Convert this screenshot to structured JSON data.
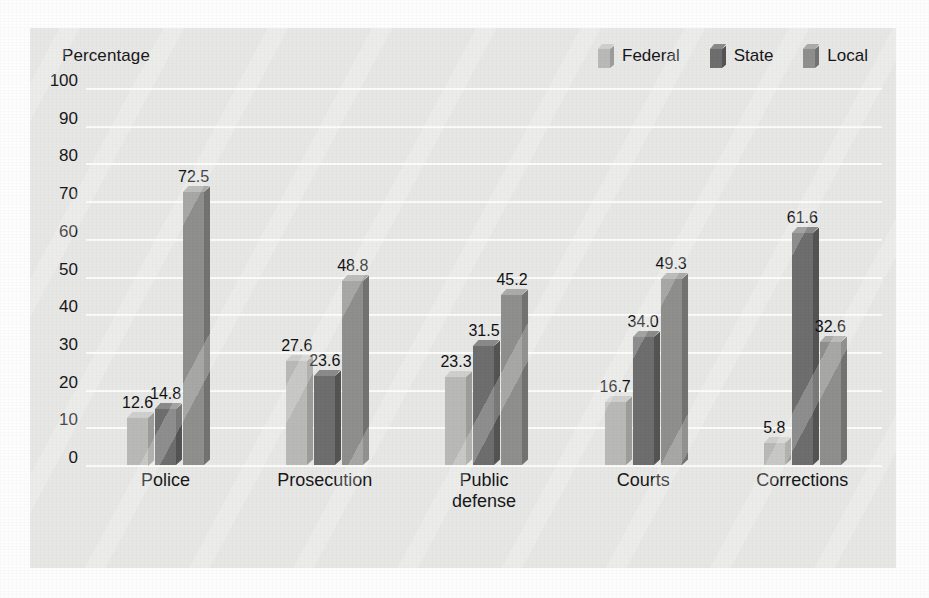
{
  "chart_data": {
    "type": "bar",
    "title": "",
    "subtitle": "",
    "ylabel": "Percentage",
    "xlabel": "",
    "ylim": [
      0,
      100
    ],
    "ytick_step": 10,
    "yticks": [
      "100",
      "90",
      "80",
      "70",
      "60",
      "50",
      "40",
      "30",
      "20",
      "10",
      "0"
    ],
    "grid": true,
    "legend_position": "top-right",
    "categories": [
      "Police",
      "Prosecution",
      "Public defense",
      "Courts",
      "Corrections"
    ],
    "category_lines": [
      [
        "Police"
      ],
      [
        "Prosecution"
      ],
      [
        "Public",
        "defense"
      ],
      [
        "Courts"
      ],
      [
        "Corrections"
      ]
    ],
    "series": [
      {
        "name": "Federal",
        "color": "#b9b9b7",
        "color_top": "#cfcfcd",
        "color_side": "#9d9d9b",
        "values": [
          12.6,
          27.6,
          23.3,
          16.7,
          5.8
        ],
        "labels": [
          "12.6",
          "27.6",
          "23.3",
          "16.7",
          "5.8"
        ]
      },
      {
        "name": "State",
        "color": "#6e6e6e",
        "color_top": "#8a8a8a",
        "color_side": "#545454",
        "values": [
          14.8,
          23.6,
          31.5,
          34.0,
          61.6
        ],
        "labels": [
          "14.8",
          "23.6",
          "31.5",
          "34.0",
          "61.6"
        ]
      },
      {
        "name": "Local",
        "color": "#8f8f8d",
        "color_top": "#ababa9",
        "color_side": "#737371",
        "values": [
          72.5,
          48.8,
          45.2,
          49.3,
          32.6
        ],
        "labels": [
          "72.5",
          "48.8",
          "45.2",
          "49.3",
          "32.6"
        ]
      }
    ]
  },
  "style": {
    "plot_background": "#e7e7e5",
    "gridline_color": "#fbfbfa",
    "text_color": "#18181a",
    "page_background": "#fdfdfd"
  }
}
